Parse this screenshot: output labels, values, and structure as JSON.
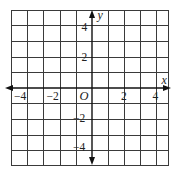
{
  "diagram": {
    "type": "coordinate-plane",
    "grid": {
      "columns": 10,
      "rows": 10,
      "x_range": [
        -5,
        5
      ],
      "y_range": [
        -5,
        5
      ],
      "cell_units": 1
    },
    "axes": {
      "x_label": "x",
      "y_label": "y",
      "origin_label": "O",
      "arrows": "both-directions"
    },
    "x_tick_labels": [
      "−4",
      "−2",
      "2",
      "4"
    ],
    "y_tick_labels": [
      "4",
      "2",
      "−2",
      "−4"
    ],
    "colors": {
      "grid": "#3a3a3a",
      "axis": "#111111",
      "background": "#ffffff"
    }
  }
}
